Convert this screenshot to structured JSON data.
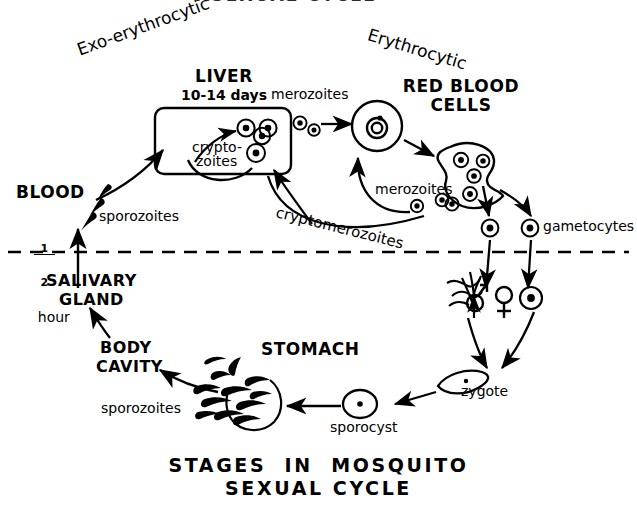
{
  "meta": {
    "diagram_title_top": "ASEXUAL CYCLE",
    "diagram_title_bottom_line1": "STAGES  IN  MOSQUITO",
    "diagram_title_bottom_line2": "SEXUAL CYCLE",
    "background_color": "#ffffff",
    "ink_color": "#000000"
  },
  "phases": {
    "exo_erythrocytic": "Exo-erythrocytic",
    "erythrocytic": "Erythrocytic"
  },
  "human_side": {
    "liver": {
      "heading": "LIVER",
      "duration": "10-14 days",
      "inner_label_line1": "crypto-",
      "inner_label_line2": "zoites"
    },
    "blood": {
      "heading": "BLOOD",
      "duration_numerator": "1",
      "duration_denominator": "2",
      "duration_unit": "hour",
      "stage_label": "sporozoites"
    },
    "red_blood_cells": {
      "heading_line1": "RED BLOOD",
      "heading_line2": "CELLS",
      "merozoites_top": "merozoites",
      "merozoites_inner": "merozoites",
      "cryptomerozoites": "cryptomerozoites",
      "gametocytes": "gametocytes"
    }
  },
  "mosquito_side": {
    "stomach": "STOMACH",
    "zygote": "zygote",
    "sporocyst": "sporocyst",
    "sporozoites": "sporozoites",
    "body_cavity_line1": "BODY",
    "body_cavity_line2": "CAVITY",
    "salivary_gland_line1": "SALIVARY",
    "salivary_gland_line2": "GLAND",
    "male_symbol": "♂",
    "female_symbol": "♀"
  },
  "divider": {
    "name": "host-boundary-dashed-line"
  }
}
